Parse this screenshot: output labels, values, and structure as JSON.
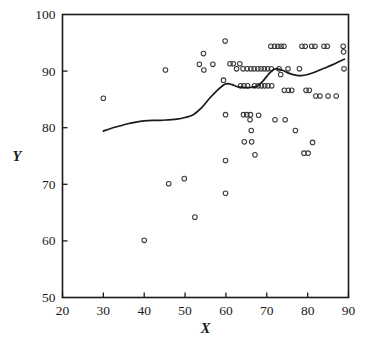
{
  "chart_data": {
    "type": "scatter",
    "title": "",
    "xlabel": "X",
    "ylabel": "Y",
    "xlim": [
      20,
      90
    ],
    "ylim": [
      50,
      100
    ],
    "xticks": [
      20,
      30,
      40,
      50,
      60,
      70,
      80,
      90
    ],
    "yticks": [
      50,
      60,
      70,
      80,
      90,
      100
    ],
    "xtick_labels": [
      "20",
      "30",
      "40",
      "50",
      "60",
      "70",
      "80",
      "90"
    ],
    "ytick_labels": [
      "50",
      "60",
      "70",
      "80",
      "90",
      "100"
    ],
    "grid": false,
    "legend": null,
    "marker": "open-circle",
    "marker_color": "#3a3a3a",
    "points": [
      [
        30.0,
        85.2
      ],
      [
        40.0,
        60.1
      ],
      [
        45.2,
        90.2
      ],
      [
        46.0,
        70.1
      ],
      [
        49.8,
        71.0
      ],
      [
        52.4,
        64.2
      ],
      [
        53.5,
        91.2
      ],
      [
        54.5,
        93.1
      ],
      [
        54.6,
        90.2
      ],
      [
        56.8,
        91.2
      ],
      [
        59.4,
        88.4
      ],
      [
        59.8,
        95.3
      ],
      [
        59.9,
        82.3
      ],
      [
        59.9,
        74.2
      ],
      [
        59.9,
        68.4
      ],
      [
        61.0,
        91.3
      ],
      [
        61.8,
        91.3
      ],
      [
        62.6,
        90.4
      ],
      [
        63.4,
        91.3
      ],
      [
        63.6,
        87.4
      ],
      [
        64.2,
        90.4
      ],
      [
        64.3,
        82.3
      ],
      [
        64.4,
        87.4
      ],
      [
        64.5,
        77.5
      ],
      [
        65.1,
        82.3
      ],
      [
        65.2,
        90.4
      ],
      [
        65.3,
        87.4
      ],
      [
        65.9,
        81.4
      ],
      [
        66.0,
        82.3
      ],
      [
        66.1,
        90.4
      ],
      [
        66.2,
        79.5
      ],
      [
        66.3,
        77.5
      ],
      [
        66.9,
        90.4
      ],
      [
        67.0,
        87.4
      ],
      [
        67.1,
        75.2
      ],
      [
        67.8,
        90.4
      ],
      [
        67.9,
        87.4
      ],
      [
        68.0,
        82.2
      ],
      [
        68.6,
        90.4
      ],
      [
        68.7,
        87.4
      ],
      [
        69.4,
        90.4
      ],
      [
        69.5,
        87.4
      ],
      [
        70.2,
        90.4
      ],
      [
        70.3,
        87.4
      ],
      [
        71.0,
        94.4
      ],
      [
        71.1,
        90.4
      ],
      [
        71.2,
        87.4
      ],
      [
        71.9,
        94.4
      ],
      [
        72.0,
        81.4
      ],
      [
        72.7,
        94.4
      ],
      [
        73.0,
        90.4
      ],
      [
        73.4,
        89.4
      ],
      [
        73.5,
        94.4
      ],
      [
        74.2,
        94.4
      ],
      [
        74.3,
        86.6
      ],
      [
        74.5,
        81.4
      ],
      [
        75.2,
        90.4
      ],
      [
        75.3,
        86.6
      ],
      [
        76.1,
        86.6
      ],
      [
        77.0,
        79.5
      ],
      [
        78.0,
        90.4
      ],
      [
        78.6,
        94.4
      ],
      [
        79.1,
        75.5
      ],
      [
        79.4,
        94.4
      ],
      [
        79.6,
        86.6
      ],
      [
        80.1,
        75.5
      ],
      [
        80.4,
        86.6
      ],
      [
        81.0,
        94.4
      ],
      [
        81.2,
        77.4
      ],
      [
        81.8,
        94.4
      ],
      [
        82.0,
        85.6
      ],
      [
        83.0,
        85.6
      ],
      [
        84.0,
        94.4
      ],
      [
        84.8,
        94.4
      ],
      [
        85.0,
        85.6
      ],
      [
        87.0,
        85.6
      ],
      [
        88.7,
        94.4
      ],
      [
        88.8,
        93.4
      ],
      [
        88.9,
        90.4
      ]
    ],
    "trend_curve": {
      "label": "smoothed fit",
      "color": "#1a1a1a",
      "points": [
        [
          30.0,
          79.4
        ],
        [
          32.0,
          79.9
        ],
        [
          34.0,
          80.3
        ],
        [
          36.0,
          80.7
        ],
        [
          38.0,
          81.0
        ],
        [
          40.0,
          81.2
        ],
        [
          42.0,
          81.3
        ],
        [
          44.0,
          81.3
        ],
        [
          46.0,
          81.4
        ],
        [
          48.0,
          81.5
        ],
        [
          50.0,
          81.8
        ],
        [
          52.0,
          82.3
        ],
        [
          54.0,
          83.5
        ],
        [
          56.0,
          85.2
        ],
        [
          58.0,
          86.7
        ],
        [
          59.5,
          87.6
        ],
        [
          60.5,
          87.8
        ],
        [
          61.5,
          87.6
        ],
        [
          63.0,
          87.2
        ],
        [
          64.5,
          87.1
        ],
        [
          66.0,
          87.1
        ],
        [
          67.5,
          87.3
        ],
        [
          69.0,
          88.2
        ],
        [
          70.5,
          89.5
        ],
        [
          71.5,
          90.2
        ],
        [
          72.5,
          90.4
        ],
        [
          74.0,
          90.1
        ],
        [
          75.5,
          89.6
        ],
        [
          77.0,
          89.3
        ],
        [
          78.5,
          89.2
        ],
        [
          80.0,
          89.4
        ],
        [
          82.0,
          89.9
        ],
        [
          84.0,
          90.5
        ],
        [
          86.0,
          91.1
        ],
        [
          88.0,
          91.8
        ],
        [
          89.0,
          92.1
        ]
      ]
    }
  }
}
